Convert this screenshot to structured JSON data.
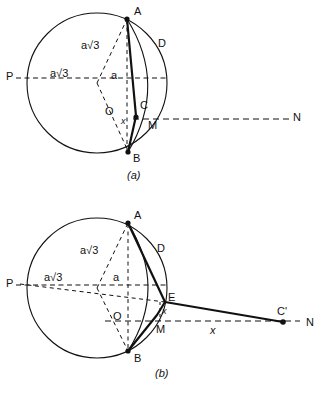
{
  "figure": {
    "stroke_color": "#111111",
    "background_color": "#ffffff"
  },
  "panels": [
    {
      "id": "panel-a",
      "caption": "(a)",
      "circle": {
        "cx": 97,
        "cy": 83,
        "r": 70
      },
      "points": [
        {
          "name": "A",
          "label": "A",
          "x": 127,
          "y": 18,
          "dot": true,
          "lx": 134,
          "ly": 6
        },
        {
          "name": "B",
          "label": "B",
          "x": 128,
          "y": 152,
          "dot": true,
          "lx": 133,
          "ly": 153
        },
        {
          "name": "C",
          "label": "C",
          "x": 137,
          "y": 117,
          "dot": true,
          "lx": 140,
          "ly": 100
        },
        {
          "name": "D",
          "label": "D",
          "x": 160,
          "y": 45,
          "dot": false,
          "lx": 158,
          "ly": 38
        },
        {
          "name": "O",
          "label": "O",
          "x": 112,
          "y": 113,
          "dot": false,
          "lx": 105,
          "ly": 106
        },
        {
          "name": "M",
          "label": "M",
          "x": 150,
          "y": 119,
          "dot": false,
          "lx": 148,
          "ly": 120
        },
        {
          "name": "P",
          "label": "P",
          "x": 27,
          "y": 78,
          "dot": false,
          "lx": 6,
          "ly": 71
        },
        {
          "name": "N",
          "label": "N",
          "x": 290,
          "y": 119,
          "dot": false,
          "lx": 293,
          "ly": 112
        }
      ],
      "measure_labels": [
        {
          "name": "a-root-3-upper",
          "text": "a√3",
          "x": 81,
          "y": 40
        },
        {
          "name": "a-root-3-left",
          "text": "a√3",
          "x": 50,
          "y": 68
        },
        {
          "name": "a-vertical",
          "text": "a",
          "x": 111,
          "y": 70
        },
        {
          "name": "x-segment",
          "text": "x",
          "x": 121,
          "y": 117
        }
      ]
    },
    {
      "id": "panel-b",
      "caption": "(b)",
      "circle": {
        "cx": 97,
        "cy": 288,
        "r": 70
      },
      "points": [
        {
          "name": "A",
          "label": "A",
          "x": 128,
          "y": 222,
          "dot": true,
          "lx": 134,
          "ly": 210
        },
        {
          "name": "B",
          "label": "B",
          "x": 128,
          "y": 352,
          "dot": true,
          "lx": 134,
          "ly": 353
        },
        {
          "name": "D",
          "label": "D",
          "x": 160,
          "y": 250,
          "dot": false,
          "lx": 157,
          "ly": 243
        },
        {
          "name": "E",
          "label": "E",
          "x": 165,
          "y": 302,
          "dot": false,
          "lx": 168,
          "ly": 292
        },
        {
          "name": "C-prime",
          "label": "C'",
          "x": 283,
          "y": 322,
          "dot": true,
          "lx": 277,
          "ly": 306
        },
        {
          "name": "M",
          "label": "M",
          "x": 160,
          "y": 320,
          "dot": false,
          "lx": 156,
          "ly": 324
        },
        {
          "name": "O",
          "label": "O",
          "x": 122,
          "y": 320,
          "dot": false,
          "lx": 113,
          "ly": 311
        },
        {
          "name": "P",
          "label": "P",
          "x": 27,
          "y": 285,
          "dot": false,
          "lx": 6,
          "ly": 278
        },
        {
          "name": "N",
          "label": "N",
          "x": 305,
          "y": 322,
          "dot": false,
          "lx": 306,
          "ly": 317
        }
      ],
      "measure_labels": [
        {
          "name": "a-root-3-upper",
          "text": "a√3",
          "x": 80,
          "y": 245
        },
        {
          "name": "a-root-3-left",
          "text": "a√3",
          "x": 44,
          "y": 272
        },
        {
          "name": "a-vertical",
          "text": "a",
          "x": 113,
          "y": 272
        },
        {
          "name": "x-angle",
          "text": "x",
          "x": 162,
          "y": 307
        },
        {
          "name": "x-distance",
          "text": "x",
          "x": 210,
          "y": 325
        }
      ]
    }
  ]
}
